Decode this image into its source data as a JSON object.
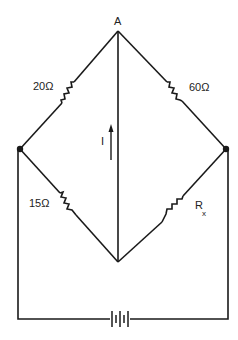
{
  "diagram": {
    "type": "wheatstone-bridge",
    "nodes": {
      "top": {
        "label": "A"
      },
      "left": {
        "label": ""
      },
      "right": {
        "label": ""
      },
      "bottom": {
        "label": ""
      }
    },
    "resistors": [
      {
        "id": "r1",
        "branch": "left-top",
        "label": "20Ω"
      },
      {
        "id": "r2",
        "branch": "right-top",
        "label": "60Ω"
      },
      {
        "id": "r3",
        "branch": "left-bottom",
        "label": "15Ω"
      },
      {
        "id": "r4",
        "branch": "right-bottom",
        "label_main": "R",
        "label_sub": "x"
      }
    ],
    "current": {
      "label": "I",
      "direction": "up"
    },
    "source": {
      "type": "battery",
      "icon": "battery-icon"
    },
    "colors": {
      "line": "#1a1a1a",
      "background": "#ffffff"
    }
  }
}
